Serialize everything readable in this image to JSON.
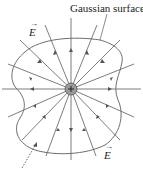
{
  "diagram": {
    "title_label": "Gaussian surface",
    "field_label_top": "E",
    "field_label_bottom": "E",
    "charge_symbol": "+",
    "caption_fragment": "The… charge…field…through…",
    "colors": {
      "lines": "#6e6e6e",
      "surface": "#6e6e6e",
      "charge_fill": "#9a9a9a",
      "text": "#222222"
    },
    "charge_center": [
      71,
      89
    ],
    "field_line_count": 16
  }
}
